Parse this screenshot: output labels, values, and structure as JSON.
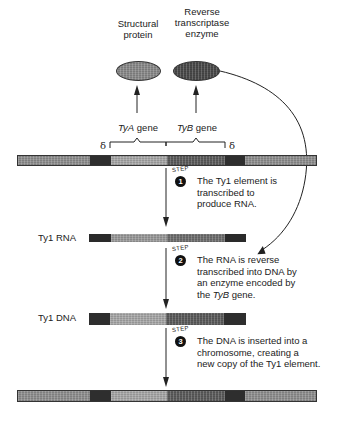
{
  "proteins": {
    "structural": {
      "label_line1": "Structural",
      "label_line2": "protein",
      "color": "#8a8a8a"
    },
    "reverse_transcriptase": {
      "label_line1": "Reverse",
      "label_line2": "transcriptase",
      "label_line3": "enzyme",
      "color": "#4a4a4a"
    }
  },
  "genes": {
    "tya": {
      "name": "TyA",
      "suffix": " gene"
    },
    "tyb": {
      "name": "TyB",
      "suffix": " gene"
    },
    "delta_left": "δ",
    "delta_right": "δ"
  },
  "rows": {
    "rna_label": "Ty1 RNA",
    "dna_label": "Ty1 DNA"
  },
  "steps": [
    {
      "number": "1",
      "word": "STEP",
      "text_lines": [
        "The Ty1 element is",
        "transcribed to",
        "produce RNA."
      ]
    },
    {
      "number": "2",
      "word": "STEP",
      "text_lines": [
        "The RNA is reverse",
        "transcribed into DNA by",
        "an enzyme encoded by"
      ],
      "last_line_prefix": "the ",
      "last_line_italic": "TyB",
      "last_line_suffix": " gene."
    },
    {
      "number": "3",
      "word": "STEP",
      "text_lines": [
        "The DNA is inserted into a",
        "chromosome, creating a",
        "new copy of the Ty1 element."
      ]
    }
  ],
  "colors": {
    "flank": "#8f8f8f",
    "delta_dark": "#2e2e2e",
    "tya_region": "#a8a8a8",
    "tyb_region": "#5c5c5c",
    "rna_dark": "#2a2a2a",
    "rna_light": "#9a9a9a",
    "line": "#222222"
  }
}
